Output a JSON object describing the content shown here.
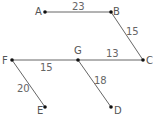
{
  "diagram": {
    "type": "weighted-graph",
    "nodes": [
      {
        "id": "A",
        "label": "A",
        "x": 45,
        "y": 12
      },
      {
        "id": "B",
        "label": "B",
        "x": 111,
        "y": 12
      },
      {
        "id": "C",
        "label": "C",
        "x": 143,
        "y": 60
      },
      {
        "id": "G",
        "label": "G",
        "x": 78,
        "y": 60
      },
      {
        "id": "F",
        "label": "F",
        "x": 12,
        "y": 60
      },
      {
        "id": "E",
        "label": "E",
        "x": 45,
        "y": 107
      },
      {
        "id": "D",
        "label": "D",
        "x": 111,
        "y": 107
      }
    ],
    "edges": [
      {
        "from": "A",
        "to": "B",
        "weight": "23"
      },
      {
        "from": "B",
        "to": "C",
        "weight": "15"
      },
      {
        "from": "G",
        "to": "C",
        "weight": "13"
      },
      {
        "from": "F",
        "to": "G",
        "weight": "15"
      },
      {
        "from": "F",
        "to": "E",
        "weight": "20"
      },
      {
        "from": "G",
        "to": "D",
        "weight": "18"
      }
    ]
  }
}
